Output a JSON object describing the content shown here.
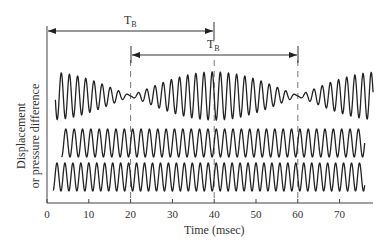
{
  "chart_data": {
    "type": "line",
    "title": "",
    "xlabel": "Time (msec)",
    "ylabel_line1": "Displacement",
    "ylabel_line2": "or pressure difference",
    "xlim": [
      0,
      78
    ],
    "x_ticks": [
      0,
      10,
      20,
      30,
      40,
      50,
      60,
      70
    ],
    "x_tick_labels": [
      "0",
      "10",
      "20",
      "30",
      "40",
      "50",
      "60",
      "70"
    ],
    "grid": false,
    "legend": null,
    "series": [
      {
        "name": "sum (beats)",
        "description": "Superposition of two tones, amplitude modulated; minima near 20 ms and 60 ms, maximum near 40 ms",
        "carrier_hz": 512.5,
        "beat_hz": 25,
        "t_start": 2,
        "t_end": 78,
        "relative_amplitude": 2
      },
      {
        "name": "tone 1",
        "frequency_hz": 500,
        "t_start": 3.5,
        "t_end": 76,
        "relative_amplitude": 1
      },
      {
        "name": "tone 2",
        "frequency_hz": 525,
        "t_start": 1.5,
        "t_end": 76,
        "relative_amplitude": 1
      }
    ],
    "annotations": [
      {
        "label_main": "T",
        "label_sub": "B",
        "type": "double-arrow",
        "from": 0,
        "to": 40
      },
      {
        "label_main": "T",
        "label_sub": "B",
        "type": "double-arrow",
        "from": 20,
        "to": 60
      }
    ],
    "dashed_verticals": [
      20,
      40,
      60
    ],
    "beat_period_ms": 40
  },
  "labels": {
    "xlabel": "Time (msec)",
    "ylabel_line1": "Displacement",
    "ylabel_line2": "or pressure difference",
    "tb_main": "T",
    "tb_sub": "B",
    "ticks": [
      "0",
      "10",
      "20",
      "30",
      "40",
      "50",
      "60",
      "70"
    ]
  }
}
